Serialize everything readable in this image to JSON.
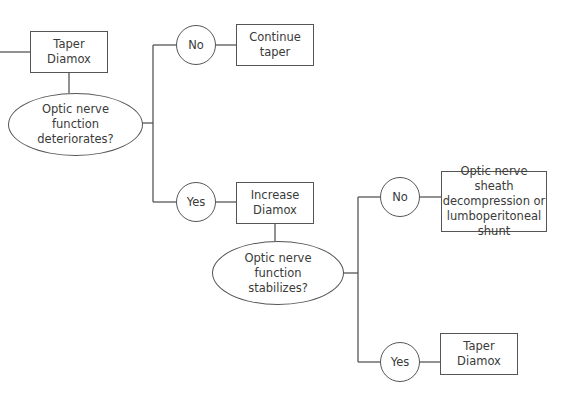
{
  "diagram": {
    "type": "flowchart",
    "nodes": {
      "taper_diamox_1": {
        "label": "Taper\nDiamox"
      },
      "decision_deteriorates": {
        "label": "Optic nerve\nfunction\ndeteriorates?"
      },
      "no_1": {
        "label": "No"
      },
      "continue_taper": {
        "label": "Continue\ntaper"
      },
      "yes_1": {
        "label": "Yes"
      },
      "increase_diamox": {
        "label": "Increase\nDiamox"
      },
      "decision_stabilizes": {
        "label": "Optic nerve\nfunction\nstabilizes?"
      },
      "no_2": {
        "label": "No"
      },
      "surgery": {
        "label": "Optic nerve sheath\ndecompression or\nlumboperitoneal\nshunt"
      },
      "yes_2": {
        "label": "Yes"
      },
      "taper_diamox_2": {
        "label": "Taper\nDiamox"
      }
    },
    "edges": [
      [
        "taper_diamox_1",
        "decision_deteriorates"
      ],
      [
        "decision_deteriorates",
        "no_1"
      ],
      [
        "no_1",
        "continue_taper"
      ],
      [
        "decision_deteriorates",
        "yes_1"
      ],
      [
        "yes_1",
        "increase_diamox"
      ],
      [
        "increase_diamox",
        "decision_stabilizes"
      ],
      [
        "decision_stabilizes",
        "no_2"
      ],
      [
        "no_2",
        "surgery"
      ],
      [
        "decision_stabilizes",
        "yes_2"
      ],
      [
        "yes_2",
        "taper_diamox_2"
      ]
    ],
    "colors": {
      "stroke": "#555555",
      "text": "#3a3a3a",
      "background": "#ffffff"
    }
  }
}
